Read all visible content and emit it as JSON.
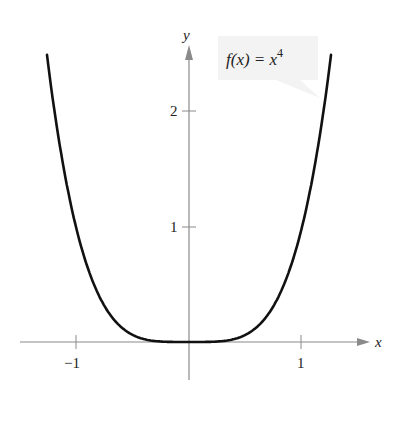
{
  "chart_data": {
    "type": "line",
    "title": "",
    "function_label": "f(x) = x^4",
    "function_label_parts": {
      "lhs": "f(x) = x",
      "exp": "4"
    },
    "xlabel": "x",
    "ylabel": "y",
    "x_ticks": [
      {
        "value": -1,
        "label": "−1"
      },
      {
        "value": 1,
        "label": "1"
      }
    ],
    "y_ticks": [
      {
        "value": 1,
        "label": "1"
      },
      {
        "value": 2,
        "label": "2"
      }
    ],
    "xlim": [
      -1.5,
      1.6
    ],
    "ylim": [
      -0.7,
      2.85
    ],
    "grid": false,
    "series": [
      {
        "name": "f(x) = x^4",
        "x": [
          -1.257,
          -1.2,
          -1.1,
          -1.0,
          -0.9,
          -0.8,
          -0.7,
          -0.6,
          -0.5,
          -0.4,
          -0.3,
          -0.2,
          -0.1,
          0,
          0.1,
          0.2,
          0.3,
          0.4,
          0.5,
          0.6,
          0.7,
          0.8,
          0.9,
          1.0,
          1.1,
          1.2,
          1.257
        ],
        "y": [
          2.5,
          2.0736,
          1.4641,
          1.0,
          0.6561,
          0.4096,
          0.2401,
          0.1296,
          0.0625,
          0.0256,
          0.0081,
          0.0016,
          0.0001,
          0,
          0.0001,
          0.0016,
          0.0081,
          0.0256,
          0.0625,
          0.1296,
          0.2401,
          0.4096,
          0.6561,
          1.0,
          1.4641,
          2.0736,
          2.5
        ]
      }
    ],
    "colors": {
      "curve": "#111111",
      "axis": "#8a8a8a",
      "label_box": "#f2f2f2"
    }
  }
}
